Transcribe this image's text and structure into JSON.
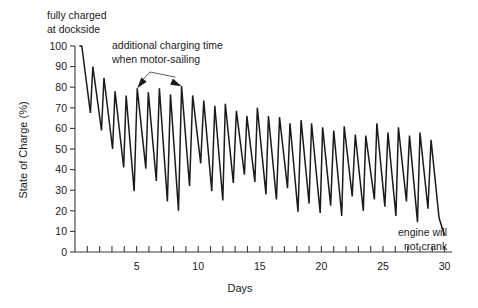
{
  "chart_data": {
    "type": "line",
    "title": "",
    "xlabel": "Days",
    "ylabel": "State of Charge (%)",
    "xlim": [
      0,
      30.6
    ],
    "ylim": [
      0,
      100
    ],
    "grid": false,
    "legend": null,
    "x_ticks_major": [
      5,
      10,
      15,
      20,
      25,
      30
    ],
    "x_ticks_minor": [
      1,
      2,
      3,
      4,
      5,
      6,
      7,
      8,
      9,
      10,
      11,
      12,
      13,
      14,
      15,
      16,
      17,
      18,
      19,
      20,
      21,
      22,
      23,
      24,
      25,
      26,
      27,
      28,
      29,
      30
    ],
    "x_ticklabels": [
      "5",
      "10",
      "15",
      "20",
      "25",
      "30"
    ],
    "y_ticks": [
      0,
      10,
      20,
      30,
      40,
      50,
      60,
      70,
      80,
      90,
      100
    ],
    "y_ticklabels": [
      "0",
      "10",
      "20",
      "30",
      "40",
      "50",
      "60",
      "70",
      "80",
      "90",
      "100"
    ],
    "series": [
      {
        "name": "State of Charge",
        "color": "#1a1a1a",
        "x": [
          0.35,
          0.55,
          1.25,
          1.45,
          2.15,
          2.35,
          3.05,
          3.25,
          3.95,
          4.15,
          4.8,
          5.05,
          5.75,
          5.95,
          6.6,
          6.85,
          7.5,
          7.75,
          8.4,
          8.65,
          9.3,
          9.55,
          10.2,
          10.45,
          11.1,
          11.35,
          12.0,
          12.2,
          12.85,
          13.1,
          13.75,
          13.95,
          14.6,
          14.8,
          15.5,
          15.7,
          16.35,
          16.6,
          17.25,
          17.45,
          18.1,
          18.35,
          19.0,
          19.2,
          19.9,
          20.1,
          20.75,
          21.0,
          21.65,
          21.85,
          22.5,
          22.75,
          23.4,
          23.6,
          24.3,
          24.5,
          25.15,
          25.4,
          26.05,
          26.25,
          26.9,
          27.15,
          27.8,
          28.0,
          28.65,
          28.9,
          29.55,
          30.0
        ],
        "y": [
          100,
          100,
          67.5,
          90,
          59,
          84.5,
          50,
          78,
          41,
          76,
          29.5,
          79.5,
          40.5,
          77.5,
          34.5,
          79.5,
          24.5,
          76.5,
          20,
          80.5,
          32,
          76,
          43,
          73.5,
          29.5,
          71,
          25,
          72,
          33.5,
          68.5,
          37.5,
          66,
          34,
          70,
          28,
          66,
          25.5,
          65.5,
          31,
          62.5,
          19.5,
          64,
          23.5,
          62.5,
          19,
          60.5,
          22.5,
          59,
          17.5,
          61,
          27,
          57,
          20,
          56.5,
          25.5,
          62.5,
          22,
          58,
          17.5,
          60.5,
          24.5,
          56.5,
          14.5,
          58,
          21,
          54.5,
          16.5,
          8
        ]
      }
    ],
    "annotations": [
      {
        "id": "fully-charged",
        "text_lines": [
          "fully charged",
          "at dockside"
        ],
        "target_x": 0.35,
        "target_y": 100
      },
      {
        "id": "additional-charging",
        "text_lines": [
          "additional charging time",
          "when motor-sailing"
        ],
        "target_points": [
          [
            5.05,
            79.5
          ],
          [
            8.65,
            80.5
          ]
        ]
      },
      {
        "id": "engine-will-not-crank",
        "text_lines": [
          "engine will",
          "not crank"
        ],
        "target_x": 30.0,
        "target_y": 8
      }
    ]
  }
}
